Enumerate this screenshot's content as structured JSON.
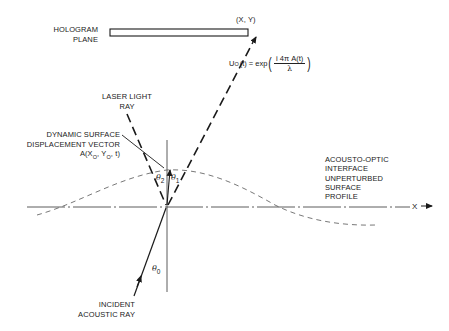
{
  "diagram": {
    "labels": {
      "hologram_line1": "HOLOGRAM",
      "hologram_line2": "PLANE",
      "point_xy": "(X, Y)",
      "laser_line1": "LASER LIGHT",
      "laser_line2": "RAY",
      "dsdv_line1": "DYNAMIC SURFACE",
      "dsdv_line2": "DISPLACEMENT VECTOR",
      "dsdv_line3_prefix": "A(X",
      "dsdv_line3_sub1": "O",
      "dsdv_line3_mid": ", Y",
      "dsdv_line3_sub2": "O",
      "dsdv_line3_suffix": ", t)",
      "interface_line1": "ACOUSTO-OPTIC",
      "interface_line2": "INTERFACE",
      "interface_line3": "UNPERTURBED",
      "interface_line4": "SURFACE",
      "interface_line5": "PROFILE",
      "x_axis": "X",
      "incident_line1": "INCIDENT",
      "incident_line2": "ACOUSTIC RAY"
    },
    "angles": {
      "theta0": "θ",
      "theta0_sub": "0",
      "theta1": "θ",
      "theta1_sub": "1",
      "theta2": "θ",
      "theta2_sub": "2"
    },
    "formula": {
      "lhs": "U",
      "lhs_sub": "O",
      "lhs_arg": "(t) = exp",
      "numerator": "i 4π A(t)",
      "denominator": "λ"
    },
    "colors": {
      "ink": "#1a1a1a",
      "surface_dash": "#555555",
      "background": "#ffffff"
    }
  }
}
